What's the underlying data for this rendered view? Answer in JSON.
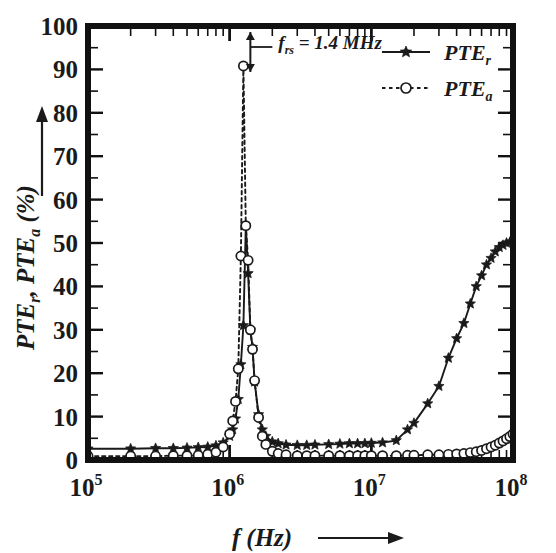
{
  "figure": {
    "background_color": "#ffffff",
    "ink_color": "#1a1a1a",
    "frame_color": "#111111"
  },
  "axes": {
    "x": {
      "label_main": "f",
      "label_unit": "(Hz)",
      "arrow": "right-arrow-icon",
      "scale": "log",
      "min": 100000,
      "max": 100000000,
      "tick_values": [
        100000,
        1000000,
        10000000,
        100000000
      ],
      "tick_labels": [
        "10",
        "10",
        "10",
        "10"
      ],
      "tick_exponents": [
        "5",
        "6",
        "7",
        "8"
      ],
      "minor_ticks": true
    },
    "y": {
      "label_main": "PTE",
      "label_sub1": "r",
      "label_mid": ", PTE",
      "label_sub2": "a",
      "label_unit": " (%)",
      "arrow": "up-arrow-icon",
      "scale": "linear",
      "min": 0,
      "max": 100,
      "tick_values": [
        0,
        10,
        20,
        30,
        40,
        50,
        60,
        70,
        80,
        90,
        100
      ],
      "tick_labels": [
        "0",
        "10",
        "20",
        "30",
        "40",
        "50",
        "60",
        "70",
        "80",
        "90",
        "100"
      ]
    }
  },
  "annotation": {
    "text_main": "f",
    "text_sub": "rs",
    "text_rest": " = 1.4 MHz",
    "full_text": "f_rs = 1.4 MHz",
    "value": 1.4,
    "unit": "MHz",
    "pointer_frequency": 1400000,
    "marker": "double-arrow-icon"
  },
  "legend": {
    "position": "top-right",
    "entries": [
      {
        "label_main": "PTE",
        "label_sub": "r",
        "series_key": "PTE_r",
        "line_style": "solid",
        "marker": "star"
      },
      {
        "label_main": "PTE",
        "label_sub": "a",
        "series_key": "PTE_a",
        "line_style": "dotted",
        "marker": "circle"
      }
    ]
  },
  "chart_data": {
    "type": "line",
    "title": "",
    "subtitle": "",
    "xlabel": "f (Hz)",
    "ylabel": "PTE_r, PTE_a (%)",
    "xscale": "log",
    "yscale": "linear",
    "xlim": [
      100000,
      100000000
    ],
    "ylim": [
      0,
      100
    ],
    "grid": false,
    "legend_position": "top-right",
    "annotations": [
      {
        "text": "f_rs = 1.4 MHz",
        "x": 1400000,
        "y": 96
      }
    ],
    "series": [
      {
        "name": "PTE_r",
        "line_style": "solid",
        "marker": "star",
        "x": [
          100000,
          200000,
          300000,
          400000,
          500000,
          600000,
          700000,
          800000,
          900000,
          1000000,
          1050000,
          1100000,
          1150000,
          1200000,
          1250000,
          1300000,
          1350000,
          1400000,
          1450000,
          1500000,
          1600000,
          1700000,
          1800000,
          2000000,
          2200000,
          2500000,
          3000000,
          3500000,
          4000000,
          5000000,
          6000000,
          7000000,
          8000000,
          9000000,
          10000000,
          12000000,
          15000000,
          18000000,
          20000000,
          25000000,
          30000000,
          35000000,
          40000000,
          45000000,
          50000000,
          55000000,
          60000000,
          65000000,
          70000000,
          75000000,
          80000000,
          85000000,
          90000000,
          95000000,
          100000000
        ],
        "y": [
          2.6,
          2.6,
          2.7,
          2.7,
          2.8,
          2.9,
          3.0,
          3.3,
          4.0,
          5.5,
          7.0,
          9.5,
          14.0,
          22.0,
          31.0,
          54.0,
          43.0,
          30.0,
          26.0,
          18.0,
          10.5,
          7.0,
          5.5,
          4.2,
          3.8,
          3.5,
          3.4,
          3.4,
          3.5,
          3.6,
          3.7,
          3.8,
          3.8,
          3.8,
          3.9,
          4.0,
          4.5,
          7.0,
          8.5,
          13.0,
          17.0,
          23.5,
          28.0,
          31.5,
          36.0,
          40.0,
          42.5,
          45.0,
          46.5,
          48.0,
          49.0,
          49.5,
          50.0,
          50.2,
          50.3
        ]
      },
      {
        "name": "PTE_a",
        "line_style": "dotted",
        "marker": "circle",
        "x": [
          100000,
          200000,
          300000,
          400000,
          500000,
          600000,
          700000,
          800000,
          900000,
          1000000,
          1050000,
          1100000,
          1150000,
          1200000,
          1250000,
          1300000,
          1350000,
          1400000,
          1450000,
          1500000,
          1600000,
          1700000,
          1800000,
          2000000,
          2200000,
          2500000,
          3000000,
          3500000,
          4000000,
          5000000,
          6000000,
          7000000,
          8000000,
          9000000,
          10000000,
          12000000,
          15000000,
          18000000,
          20000000,
          25000000,
          30000000,
          35000000,
          40000000,
          45000000,
          50000000,
          55000000,
          60000000,
          65000000,
          70000000,
          75000000,
          80000000,
          85000000,
          90000000,
          95000000,
          100000000
        ],
        "y": [
          0.9,
          0.9,
          0.9,
          1.0,
          1.0,
          1.1,
          1.3,
          1.8,
          3.0,
          6.0,
          9.0,
          13.5,
          21.0,
          47.0,
          90.8,
          54.0,
          46.0,
          30.0,
          25.5,
          18.3,
          9.8,
          5.5,
          3.6,
          2.0,
          1.5,
          1.2,
          1.0,
          1.0,
          1.0,
          1.0,
          1.0,
          1.0,
          1.0,
          1.0,
          1.0,
          1.0,
          1.0,
          1.1,
          1.1,
          1.2,
          1.2,
          1.3,
          1.4,
          1.5,
          1.7,
          1.9,
          2.2,
          2.6,
          3.0,
          3.4,
          3.9,
          4.4,
          4.9,
          5.4,
          6.0
        ]
      }
    ]
  }
}
